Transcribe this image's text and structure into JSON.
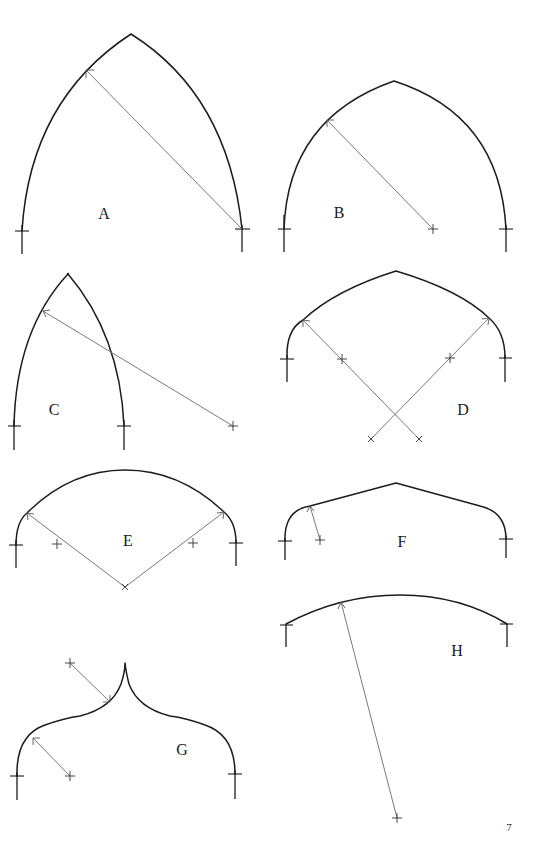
{
  "page": {
    "page_number": "7",
    "background": "#ffffff",
    "line_color": "#1c1c1c",
    "radius_line_color": "#6a6a6a"
  },
  "figures": [
    {
      "id": "A",
      "label": "A",
      "type": "equilateral-pointed-arch",
      "label_pos": [
        104,
        214
      ]
    },
    {
      "id": "B",
      "label": "B",
      "type": "drop-pointed-arch",
      "label_pos": [
        339,
        213
      ]
    },
    {
      "id": "C",
      "label": "C",
      "type": "lancet-arch",
      "label_pos": [
        54,
        410
      ]
    },
    {
      "id": "D",
      "label": "D",
      "type": "four-centred-pointed-arch",
      "label_pos": [
        463,
        410
      ]
    },
    {
      "id": "E",
      "label": "E",
      "type": "three-centred-arch",
      "label_pos": [
        128,
        541
      ]
    },
    {
      "id": "F",
      "label": "F",
      "type": "pointed-straight-sided-arch",
      "label_pos": [
        402,
        542
      ]
    },
    {
      "id": "G",
      "label": "G",
      "type": "ogee-arch",
      "label_pos": [
        182,
        750
      ]
    },
    {
      "id": "H",
      "label": "H",
      "type": "segmental-arch",
      "label_pos": [
        457,
        651
      ]
    }
  ]
}
